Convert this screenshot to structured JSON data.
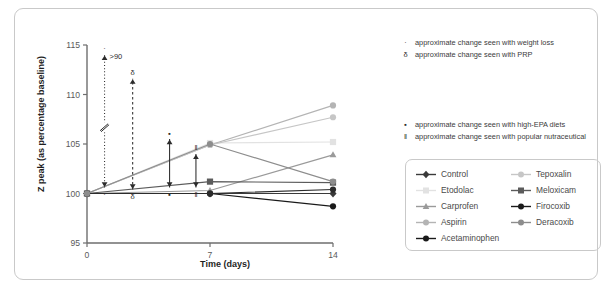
{
  "figure": {
    "border_color": "#c9c9c9"
  },
  "chart_data": {
    "type": "line",
    "title": "",
    "xlabel": "Time (days)",
    "ylabel": "Z peak (as percentage baseline)",
    "x": [
      0,
      7,
      14
    ],
    "xticks": [
      "0",
      "7",
      "14"
    ],
    "xlim": [
      0,
      14
    ],
    "ylim": [
      95,
      115
    ],
    "yticks": [
      "95",
      "100",
      "105",
      "110",
      "115"
    ],
    "grid": false,
    "legend_position": "bottom-right",
    "series": [
      {
        "name": "Control",
        "values": [
          100,
          100,
          100
        ],
        "color": "#3a3a3a",
        "marker": "diamond"
      },
      {
        "name": "Etodolac",
        "values": [
          100,
          105.1,
          105.2
        ],
        "color": "#e2e2e2",
        "marker": "square"
      },
      {
        "name": "Carprofen",
        "values": [
          100,
          100.3,
          103.9
        ],
        "color": "#9a9a9a",
        "marker": "triangle"
      },
      {
        "name": "Aspirin",
        "values": [
          100,
          104.9,
          108.9
        ],
        "color": "#b4b4b4",
        "marker": "circle"
      },
      {
        "name": "Acetaminophen",
        "values": [
          100,
          100,
          98.7
        ],
        "color": "#1a1a1a",
        "marker": "circle"
      },
      {
        "name": "Tepoxalin",
        "values": [
          100,
          104.9,
          107.7
        ],
        "color": "#c6c6c6",
        "marker": "circle"
      },
      {
        "name": "Meloxicam",
        "values": [
          100,
          101.2,
          101.1
        ],
        "color": "#5b5b5b",
        "marker": "square"
      },
      {
        "name": "Firocoxib",
        "values": [
          100,
          100,
          100.4
        ],
        "color": "#2b2b2b",
        "marker": "circle"
      },
      {
        "name": "Deracoxib",
        "values": [
          100,
          105.0,
          101.2
        ],
        "color": "#8d8d8d",
        "marker": "circle"
      }
    ],
    "annotation_arrows": [
      {
        "symbol": "·",
        "label": ">90",
        "x": 1.0,
        "from": 100.6,
        "to": 114.0,
        "axis_break": true,
        "style": "dotted"
      },
      {
        "symbol": "δ",
        "label": "",
        "x": 2.6,
        "from": 100.4,
        "to": 111.6,
        "axis_break": false,
        "style": "dashed"
      },
      {
        "symbol": "▪",
        "label": "",
        "x": 4.7,
        "from": 100.6,
        "to": 105.5,
        "axis_break": false,
        "style": "solid"
      },
      {
        "symbol": "‖",
        "label": "",
        "x": 6.2,
        "from": 100.6,
        "to": 104.0,
        "axis_break": false,
        "style": "solid"
      }
    ]
  },
  "annotations": {
    "top": [
      {
        "symbol": "·",
        "text": "approximate change seen with weight loss"
      },
      {
        "symbol": "δ",
        "text": "approximate change seen with PRP"
      }
    ],
    "middle": [
      {
        "symbol": "▪",
        "text": "approximate change seen with high-EPA diets"
      },
      {
        "symbol": "‖",
        "text": "approximate change seen with popular nutraceutical"
      }
    ]
  },
  "legend": {
    "items": [
      {
        "label": "Control",
        "color": "#3a3a3a",
        "marker": "diamond"
      },
      {
        "label": "Tepoxalin",
        "color": "#c6c6c6",
        "marker": "circle"
      },
      {
        "label": "Etodolac",
        "color": "#e2e2e2",
        "marker": "square"
      },
      {
        "label": "Meloxicam",
        "color": "#5b5b5b",
        "marker": "square"
      },
      {
        "label": "Carprofen",
        "color": "#9a9a9a",
        "marker": "triangle"
      },
      {
        "label": "Firocoxib",
        "color": "#1a1a1a",
        "marker": "circle"
      },
      {
        "label": "Aspirin",
        "color": "#b4b4b4",
        "marker": "circle"
      },
      {
        "label": "Deracoxib",
        "color": "#8d8d8d",
        "marker": "circle"
      },
      {
        "label": "Acetaminophen",
        "color": "#1a1a1a",
        "marker": "circle"
      }
    ]
  }
}
